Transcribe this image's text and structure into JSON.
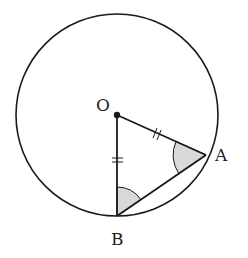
{
  "diagram": {
    "type": "geometry",
    "colors": {
      "stroke": "#1a1a1a",
      "shade": "#d9d9d9",
      "background": "#ffffff"
    },
    "circle": {
      "center_label": "O",
      "cx": 117,
      "cy": 115,
      "r": 101
    },
    "points": {
      "O": {
        "label": "O",
        "x": 117,
        "y": 115
      },
      "A": {
        "label": "A",
        "x": 206,
        "y": 155
      },
      "B": {
        "label": "B",
        "x": 117,
        "y": 216
      }
    },
    "segments": [
      {
        "from": "O",
        "to": "A",
        "tick_marks": 2
      },
      {
        "from": "O",
        "to": "B",
        "tick_marks": 2
      },
      {
        "from": "A",
        "to": "B",
        "tick_marks": 0
      }
    ],
    "shaded_angles": [
      "OAB",
      "OBA"
    ],
    "labels": {
      "O": "O",
      "A": "A",
      "B": "B"
    }
  }
}
